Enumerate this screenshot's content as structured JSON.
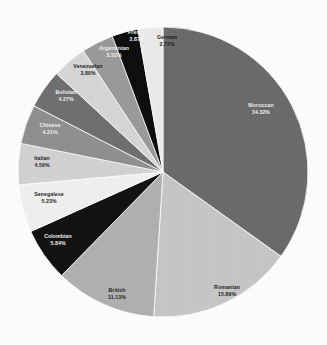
{
  "chart_data": {
    "type": "pie",
    "title": "",
    "subtitle": "",
    "xlabel": "",
    "ylabel": "",
    "legend_position": "none",
    "grid": false,
    "label_format": "name + percent",
    "start_angle_deg": 0,
    "direction": "clockwise",
    "background_color": "#fdfdfd",
    "categories": [
      "Moroccan",
      "Romanian",
      "British",
      "Colombian",
      "Senegalese",
      "Italian",
      "Chinese",
      "Bolivian",
      "Venezuelan",
      "Argentinian",
      "French",
      "German"
    ],
    "values": [
      34.32,
      15.89,
      11.13,
      5.84,
      5.23,
      4.5,
      4.31,
      4.27,
      3.8,
      3.52,
      2.87,
      2.72
    ],
    "value_unit": "%",
    "colors": [
      "#6a6a6a",
      "#c6c6c6",
      "#b0b0b0",
      "#111111",
      "#f0f0f0",
      "#d2d2d2",
      "#8f8f8f",
      "#6f6f6f",
      "#d6d6d6",
      "#9a9a9a",
      "#0d0d0d",
      "#ebebeb"
    ],
    "slices": [
      {
        "name": "Moroccan",
        "percent_text": "34.32%",
        "value": 34.32,
        "color": "#6a6a6a",
        "text_tone": "on-dark",
        "label_x": 261,
        "label_y": 109
      },
      {
        "name": "Romanian",
        "percent_text": "15.89%",
        "value": 15.89,
        "color": "#c6c6c6",
        "text_tone": "on-light",
        "label_x": 227,
        "label_y": 291
      },
      {
        "name": "British",
        "percent_text": "11.13%",
        "value": 11.13,
        "color": "#b0b0b0",
        "text_tone": "on-light",
        "label_x": 117,
        "label_y": 294
      },
      {
        "name": "Colombian",
        "percent_text": "5.84%",
        "value": 5.84,
        "color": "#111111",
        "text_tone": "on-dark",
        "label_x": 58,
        "label_y": 240
      },
      {
        "name": "Senegalese",
        "percent_text": "5.23%",
        "value": 5.23,
        "color": "#f0f0f0",
        "text_tone": "on-light",
        "label_x": 49,
        "label_y": 198
      },
      {
        "name": "Italian",
        "percent_text": "4.50%",
        "value": 4.5,
        "color": "#d2d2d2",
        "text_tone": "on-light",
        "label_x": 42,
        "label_y": 162
      },
      {
        "name": "Chinese",
        "percent_text": "4.31%",
        "value": 4.31,
        "color": "#8f8f8f",
        "text_tone": "on-dark",
        "label_x": 50,
        "label_y": 129
      },
      {
        "name": "Bolivian",
        "percent_text": "4.27%",
        "value": 4.27,
        "color": "#6f6f6f",
        "text_tone": "on-dark",
        "label_x": 66,
        "label_y": 96
      },
      {
        "name": "Venezuelan",
        "percent_text": "3.80%",
        "value": 3.8,
        "color": "#d6d6d6",
        "text_tone": "on-light",
        "label_x": 88,
        "label_y": 70
      },
      {
        "name": "Argentinian",
        "percent_text": "3.52%",
        "value": 3.52,
        "color": "#9a9a9a",
        "text_tone": "on-dark",
        "label_x": 114,
        "label_y": 52
      },
      {
        "name": "French",
        "percent_text": "2.87%",
        "value": 2.87,
        "color": "#0d0d0d",
        "text_tone": "on-dark",
        "label_x": 137,
        "label_y": 36
      },
      {
        "name": "German",
        "percent_text": "2.72%",
        "value": 2.72,
        "color": "#ebebeb",
        "text_tone": "on-light",
        "label_x": 167,
        "label_y": 41
      }
    ],
    "geometry": {
      "center_x": 163,
      "center_y": 172,
      "radius": 145
    }
  }
}
